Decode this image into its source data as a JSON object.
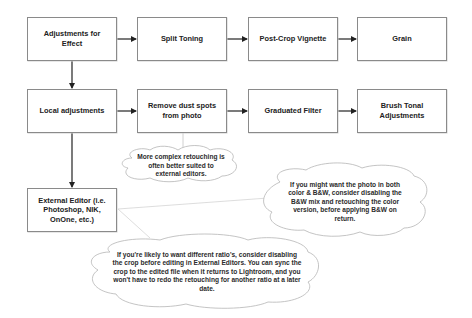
{
  "diagram": {
    "boxes": {
      "adjustments_for_effect": "Adjustments for Effect",
      "split_toning": "Split Toning",
      "post_crop_vignette": "Post-Crop Vignette",
      "grain": "Grain",
      "local_adjustments": "Local adjustments",
      "remove_dust_spots": "Remove dust spots from photo",
      "graduated_filter": "Graduated Filter",
      "brush_tonal": "Brush Tonal Adjustments",
      "external_editor": "External Editor (i.e. Photoshop, NIK, OnOne, etc.)"
    },
    "notes": {
      "complex_retouching": "More complex retouching is often better suited to external editors.",
      "color_bw": "If you might want the photo in both color & B&W, consider disabling the B&W mix and retouching the color version, before applying B&W on return.",
      "crop_ratio": "If you're likely to want different ratio's, consider disabling the crop before editing in External Editors. You can sync the crop to the edited file when it returns to Lightroom, and you won't have to redo the retouching for another ratio at a later date."
    },
    "edges": [
      [
        "adjustments_for_effect",
        "split_toning"
      ],
      [
        "split_toning",
        "post_crop_vignette"
      ],
      [
        "post_crop_vignette",
        "grain"
      ],
      [
        "adjustments_for_effect",
        "local_adjustments"
      ],
      [
        "local_adjustments",
        "remove_dust_spots"
      ],
      [
        "remove_dust_spots",
        "graduated_filter"
      ],
      [
        "graduated_filter",
        "brush_tonal"
      ],
      [
        "local_adjustments",
        "external_editor"
      ]
    ],
    "colors": {
      "box_border": "#8a8a8a",
      "arrow": "#222222",
      "cloud_border": "#b5b5b5",
      "text": "#222222"
    }
  }
}
